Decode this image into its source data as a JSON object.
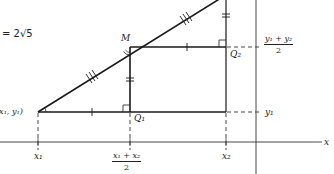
{
  "figure": {
    "type": "midpoint-formula-diagram",
    "equation_fragment": "= 2√5",
    "points": {
      "p1": {
        "label": "(x₁, y₁)"
      },
      "midpoint": {
        "label": "M"
      },
      "q1": {
        "label": "Q₁"
      },
      "q2": {
        "label": "Q₂"
      }
    },
    "axis_labels": {
      "x_axis": "x",
      "x1": "x₁",
      "x2": "x₂",
      "y1": "y₁",
      "x_mid_num": "x₁ + x₂",
      "x_mid_den": "2",
      "y_mid_num": "y₁ + y₂",
      "y_mid_den": "2"
    },
    "colors": {
      "line": "#1a1a1a",
      "dashed": "#333333",
      "background": "#ffffff"
    }
  }
}
